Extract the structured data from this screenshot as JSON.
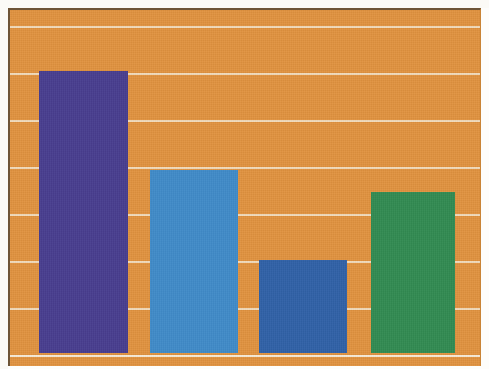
{
  "figure": {
    "width": 489,
    "height": 369,
    "background_color": "#fdfdfb",
    "plot_background_color": "#e0923f",
    "gridline_color": "#f3e2c8",
    "border_color": "#6d5436"
  },
  "chart_data": {
    "type": "bar",
    "title": "",
    "subtitle": "",
    "xlabel": "",
    "ylabel": "",
    "categories": [
      "1",
      "2",
      "3",
      "4"
    ],
    "tick_labels": [],
    "values": [
      6.0,
      3.9,
      2.0,
      3.45
    ],
    "ylim": [
      0,
      7.5
    ],
    "xlim": [
      0,
      4
    ],
    "grid": true,
    "grid_axis": "y",
    "gridline_values": [
      7.0,
      6.0,
      5.0,
      4.0,
      3.0,
      2.0,
      1.0,
      0.0
    ],
    "legend": false,
    "legend_position": "none",
    "annotations": [],
    "bar_colors": [
      "#453a8f",
      "#3d8bcb",
      "#2c5fa8",
      "#2e8b4f"
    ],
    "series": [
      {
        "name": "Series 1",
        "values": [
          6.0,
          3.9,
          2.0,
          3.45
        ]
      }
    ],
    "bars": [
      {
        "label": "1",
        "value": 6.0,
        "color": "#453a8f",
        "color_name": "purple",
        "x_px": 37,
        "width_px": 89,
        "top_px": 71,
        "bottom_px": 353
      },
      {
        "label": "2",
        "value": 3.9,
        "color": "#3d8bcb",
        "color_name": "light-blue",
        "x_px": 148,
        "width_px": 88,
        "top_px": 170,
        "bottom_px": 353
      },
      {
        "label": "3",
        "value": 2.0,
        "color": "#2c5fa8",
        "color_name": "dark-blue",
        "x_px": 257,
        "width_px": 88,
        "top_px": 260,
        "bottom_px": 353
      },
      {
        "label": "4",
        "value": 3.45,
        "color": "#2e8b4f",
        "color_name": "green",
        "x_px": 369,
        "width_px": 84,
        "top_px": 192,
        "bottom_px": 353
      }
    ]
  }
}
